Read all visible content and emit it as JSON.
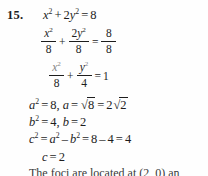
{
  "problem": {
    "number": "15.",
    "subject": "ellipse-standard-form-and-foci"
  },
  "lines": {
    "eq1": {
      "lhs_x": "x",
      "lhs_x_exp": "2",
      "plus": "+",
      "coef_y": "2",
      "lhs_y": "y",
      "lhs_y_exp": "2",
      "equals": "=",
      "rhs": "8"
    },
    "eq2": {
      "f1_num_var": "x",
      "f1_num_exp": "2",
      "f1_den": "8",
      "plus": "+",
      "f2_num_coef": "2",
      "f2_num_var": "y",
      "f2_num_exp": "2",
      "f2_den": "8",
      "equals": "=",
      "f3_num": "8",
      "f3_den": "8"
    },
    "eq3": {
      "f1_num_var": "x",
      "f1_num_exp": "2",
      "f1_den": "8",
      "plus": "+",
      "f2_num_var": "y",
      "f2_num_exp": "2",
      "f2_den": "4",
      "equals": "=",
      "rhs": "1"
    },
    "eq4": {
      "a_var": "a",
      "a_exp": "2",
      "eq1": "=",
      "a_sq_val": "8",
      "comma": ",",
      "a_var2": "a",
      "eq2": "=",
      "radical": "√",
      "radicand": "8",
      "eq3": "=",
      "simplified_coef": "2",
      "radical2": "√",
      "radicand2": "2"
    },
    "eq5": {
      "b_var": "b",
      "b_exp": "2",
      "eq1": "=",
      "b_sq_val": "4",
      "comma": ",",
      "b_var2": "b",
      "eq2": "=",
      "b_val": "2"
    },
    "eq6": {
      "c_var": "c",
      "c_exp": "2",
      "eq1": "=",
      "a_var": "a",
      "a_exp": "2",
      "minus": "–",
      "b_var": "b",
      "b_exp": "2",
      "eq2": "=",
      "val_a": "8",
      "minus2": "–",
      "val_b": "4",
      "eq3": "=",
      "result": "4"
    },
    "eq7": {
      "c_var": "c",
      "equals": "=",
      "value": "2"
    },
    "tail": "The foci are located at  (2, 0) an"
  },
  "colors": {
    "page_background": "#fefefe",
    "ink": "#1d1d1d",
    "faded_ink": "#6b6b6b"
  },
  "chart_data": {
    "type": "table",
    "categories": [
      "original equation",
      "divide by 8",
      "standard form",
      "a value",
      "b value",
      "c squared",
      "c value",
      "foci"
    ],
    "values": [
      "x^2 + 2y^2 = 8",
      "x^2/8 + 2y^2/8 = 8/8",
      "x^2/8 + y^2/4 = 1",
      "a^2 = 8, a = √8 = 2√2",
      "b^2 = 4, b = 2",
      "c^2 = a^2 – b^2 = 8 – 4 = 4",
      "c = 2",
      "(2, 0) an…"
    ]
  }
}
